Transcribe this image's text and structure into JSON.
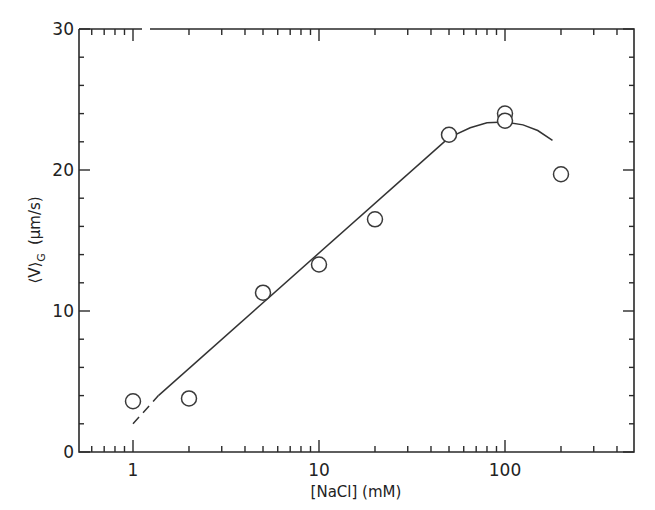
{
  "chart_data": {
    "type": "scatter",
    "title": "",
    "xlabel": "[NaCl]  (mM)",
    "ylabel": "⟨V⟩G  (μm/s)",
    "ylabel_parts": {
      "main": "⟨V⟩",
      "subscript": "G",
      "units": "(μm/s)"
    },
    "xscale": "log",
    "xlim": [
      0.5,
      500
    ],
    "ylim": [
      0,
      30
    ],
    "grid": false,
    "legend": null,
    "x_ticks": [
      1,
      10,
      100
    ],
    "x_tick_labels": [
      "1",
      "10",
      "100"
    ],
    "y_ticks": [
      0,
      10,
      20,
      30
    ],
    "y_tick_labels": [
      "0",
      "10",
      "20",
      "30"
    ],
    "y_minor_step": 2,
    "series": [
      {
        "name": "measured",
        "marker": "open-circle",
        "points": [
          {
            "x": 1,
            "y": 3.6
          },
          {
            "x": 2,
            "y": 3.8
          },
          {
            "x": 5,
            "y": 11.3
          },
          {
            "x": 10,
            "y": 13.3
          },
          {
            "x": 20,
            "y": 16.5
          },
          {
            "x": 50,
            "y": 22.5
          },
          {
            "x": 100,
            "y": 24.0
          },
          {
            "x": 100,
            "y": 23.5
          },
          {
            "x": 200,
            "y": 19.7
          }
        ]
      },
      {
        "name": "fit-dashed-extrapolation",
        "style": "dashed",
        "points": [
          {
            "x": 1,
            "y": 2.0
          },
          {
            "x": 1.37,
            "y": 4.0
          }
        ]
      },
      {
        "name": "fit-linear",
        "style": "solid",
        "points": [
          {
            "x": 1.37,
            "y": 4.0
          },
          {
            "x": 50,
            "y": 22.3
          }
        ]
      },
      {
        "name": "fit-curve",
        "style": "solid",
        "points": [
          {
            "x": 50,
            "y": 22.3
          },
          {
            "x": 65,
            "y": 23.0
          },
          {
            "x": 80,
            "y": 23.35
          },
          {
            "x": 100,
            "y": 23.4
          },
          {
            "x": 125,
            "y": 23.2
          },
          {
            "x": 150,
            "y": 22.8
          },
          {
            "x": 180,
            "y": 22.1
          }
        ]
      }
    ]
  }
}
